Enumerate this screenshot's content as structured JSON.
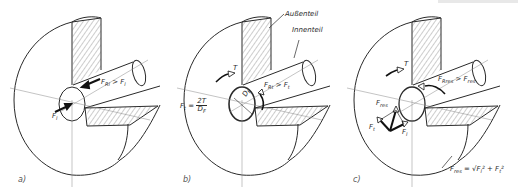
{
  "figure": {
    "colors": {
      "line": "#2a2a2a",
      "hatch": "#555555",
      "background": "#ffffff"
    }
  },
  "parts": {
    "outer_part_label": "Außenteil",
    "inner_part_label": "Innenteil"
  },
  "panels": [
    {
      "id": "a",
      "letter": "a)",
      "labels": {
        "axial_force": "F",
        "axial_force_sub": "l",
        "holding_force": "F",
        "holding_force_sub": "Rl",
        "relation": " > F",
        "relation_sub": "l"
      }
    },
    {
      "id": "b",
      "letter": "b)",
      "labels": {
        "torque": "T",
        "diameter": "D",
        "diameter_sub": "F",
        "tangential_force": "F",
        "tangential_force_sub": "t",
        "equals": " = ",
        "frac_num": "2T",
        "frac_den": "D",
        "frac_den_sub": "F",
        "holding_force": "F",
        "holding_force_sub": "Rt",
        "relation": " > F",
        "relation_sub": "t"
      }
    },
    {
      "id": "c",
      "letter": "c)",
      "labels": {
        "torque": "T",
        "resultant_force": "F",
        "resultant_force_sub": "res",
        "tangential_force": "F",
        "tangential_force_sub": "t",
        "axial_force": "F",
        "axial_force_sub": "l",
        "holding_force": "F",
        "holding_force_sub": "Rres",
        "relation": " > F",
        "relation_sub": "res",
        "formula_lhs": "F",
        "formula_lhs_sub": "res",
        "formula_rhs": " = √F",
        "formula_sub1": "l",
        "formula_mid": "² + F",
        "formula_sub2": "t",
        "formula_end": "²"
      }
    }
  ]
}
